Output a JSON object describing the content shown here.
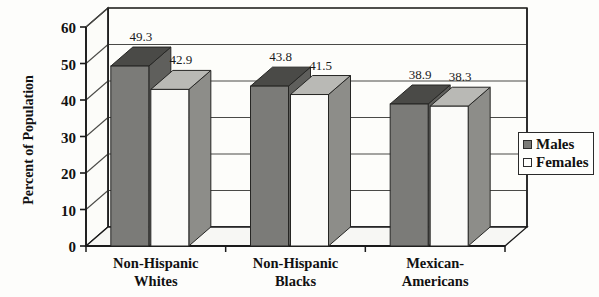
{
  "chart_data": {
    "type": "bar",
    "title": "",
    "subtitle": "",
    "xlabel": "",
    "ylabel": "Percent of Population",
    "ylim": [
      0,
      60
    ],
    "yticks": [
      0,
      10,
      20,
      30,
      40,
      50,
      60
    ],
    "ytick_labels": [
      "0",
      "10",
      "20",
      "30",
      "40",
      "50",
      "60"
    ],
    "grid": true,
    "legend_position": "right",
    "style": "3d-clustered-column",
    "categories": [
      "Non-Hispanic Whites",
      "Non-Hispanic Blacks",
      "Mexican-Americans"
    ],
    "category_lines": [
      [
        "Non-Hispanic",
        "Whites"
      ],
      [
        "Non-Hispanic",
        "Blacks"
      ],
      [
        "Mexican-",
        "Americans"
      ]
    ],
    "series": [
      {
        "name": "Males",
        "values": [
          49.3,
          43.8,
          38.9
        ],
        "color": "#7b7b78",
        "top_color": "#4a4a47",
        "side_color": "#5f5f5c"
      },
      {
        "name": "Females",
        "values": [
          42.9,
          41.5,
          38.3
        ],
        "color": "#fbfbf9",
        "top_color": "#b9b9b5",
        "side_color": "#8d8d89"
      }
    ],
    "value_labels": [
      "49.3",
      "42.9",
      "43.8",
      "41.5",
      "38.9",
      "38.3"
    ]
  },
  "legend": {
    "items": [
      {
        "label": "Males",
        "swatch": "#7b7b78"
      },
      {
        "label": "Females",
        "swatch": "#fefefc"
      }
    ]
  },
  "axis": {
    "y_title": "Percent of Population"
  },
  "colors": {
    "axis_line": "#1a1a1a",
    "grid_line": "#4a4a47",
    "plot_floor": "#f7f7f4",
    "background": "#fdfdfb"
  }
}
